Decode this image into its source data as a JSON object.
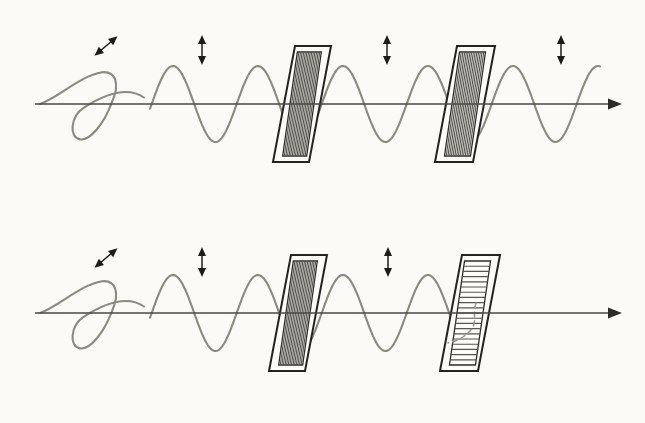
{
  "figure": {
    "background_color": "#fbfaf6",
    "width": 645,
    "height": 423,
    "wave_color": "#8c8a80",
    "axis_color": "#4a4a44",
    "panel_stroke_color": "#23231f",
    "grating_color": "#57564f",
    "arrow_color": "#1c1c1a"
  },
  "chart_data": {
    "type": "line",
    "xlabel": "",
    "ylabel": "",
    "grid": false,
    "legend": "none",
    "panels": [
      {
        "id": "top-panel",
        "label": "Parallel polarizers: light transmitted",
        "axis_y": 104,
        "axis_x_start": 35,
        "axis_x_end": 622,
        "wave_amplitude": 38,
        "wave_wavelength": 85,
        "wave_x_start": 40,
        "wave_x_end": 600,
        "unpolarized_segment_end": 150,
        "filters": [
          {
            "id": "polarizer-1-top",
            "orientation": "vertical",
            "transmission_axis_deg": 90,
            "x_left_bottom": 273,
            "x_right_top": 331,
            "slit_count": 15
          },
          {
            "id": "polarizer-2-top",
            "orientation": "vertical",
            "transmission_axis_deg": 90,
            "x_left_bottom": 435,
            "x_right_top": 495,
            "slit_count": 15
          }
        ],
        "arrows": [
          {
            "id": "arrow-unpolarized-top",
            "style": "double-diagonal",
            "angle_deg": 40,
            "x": 106,
            "y": 46
          },
          {
            "id": "arrow-vertical-1-top",
            "style": "double-vertical",
            "angle_deg": 90,
            "x": 202,
            "y": 50
          },
          {
            "id": "arrow-vertical-2-top",
            "style": "double-vertical",
            "angle_deg": 90,
            "x": 387,
            "y": 50
          },
          {
            "id": "arrow-vertical-3-top",
            "style": "double-vertical",
            "angle_deg": 90,
            "x": 561,
            "y": 50
          }
        ]
      },
      {
        "id": "bottom-panel",
        "label": "Crossed polarizers: light blocked",
        "axis_y": 313,
        "axis_x_start": 35,
        "axis_x_end": 622,
        "wave_amplitude": 38,
        "wave_wavelength": 85,
        "wave_x_start": 40,
        "wave_x_end": 452,
        "unpolarized_segment_end": 150,
        "filters": [
          {
            "id": "polarizer-1-bottom",
            "orientation": "vertical",
            "transmission_axis_deg": 90,
            "x_left_bottom": 269,
            "x_right_top": 327,
            "slit_count": 15
          },
          {
            "id": "polarizer-2-bottom",
            "orientation": "horizontal",
            "transmission_axis_deg": 0,
            "x_left_bottom": 440,
            "x_right_top": 500,
            "slit_count": 20
          }
        ],
        "arrows": [
          {
            "id": "arrow-unpolarized-bottom",
            "style": "double-diagonal",
            "angle_deg": 40,
            "x": 106,
            "y": 258
          },
          {
            "id": "arrow-vertical-1-bottom",
            "style": "double-vertical",
            "angle_deg": 90,
            "x": 202,
            "y": 262
          },
          {
            "id": "arrow-vertical-2-bottom",
            "style": "double-vertical",
            "angle_deg": 90,
            "x": 388,
            "y": 262
          }
        ]
      }
    ]
  }
}
